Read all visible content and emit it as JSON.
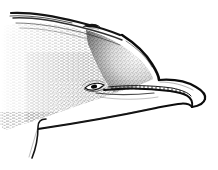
{
  "figure": {
    "view": "left lateral profile",
    "medium": "stipple and hatch pen-and-ink line drawing",
    "background_color": "#ffffff",
    "ink_color": "#1a1a1a",
    "shading_color": "#7a7a7a",
    "canvas": {
      "width": 218,
      "height": 170
    },
    "alt_text": "Black and white stippled line drawing of a dolphin head seen from the left side, showing the melon, blowhole, eye, a row of small teeth along the mouthline, the pointed rostrum and the lower jaw, with the body fading off the left edge of the frame."
  },
  "anatomy": {
    "parts": [
      {
        "id": "dorsal-ridge",
        "label": "Dorsal ridge",
        "description": "Multiple parallel dark contour strokes sweeping from upper left toward the blowhole"
      },
      {
        "id": "blowhole",
        "label": "Blowhole",
        "description": "Small dark crescent on the dorsal surface behind the melon"
      },
      {
        "id": "melon",
        "label": "Melon",
        "description": "Rounded forehead bulge with heavy graded shading on its leading edge"
      },
      {
        "id": "eye",
        "label": "Eye",
        "description": "Small almond shape with a dark pupil set low on the head behind the gape"
      },
      {
        "id": "tooth-row",
        "label": "Tooth row",
        "description": "Row of short vertical tick marks between two lines along the upper jaw"
      },
      {
        "id": "rostrum",
        "label": "Rostrum",
        "description": "Elongated beak tapering to a rounded tip at the right of the frame"
      },
      {
        "id": "mouthline",
        "label": "Mouthline",
        "description": "Long dark curve from below the eye forward to the tip of the beak"
      },
      {
        "id": "lower-jaw",
        "label": "Lower jaw",
        "description": "Sweeping lower contour running from the throat up to the beak tip"
      },
      {
        "id": "throat-crease",
        "label": "Throat crease",
        "description": "Hooked stroke descending from the lower jaw toward the lower left"
      },
      {
        "id": "flank-hatching",
        "label": "Flank hatching",
        "description": "Dense horizontal stipple texture covering the head and body mass"
      },
      {
        "id": "body-fade",
        "label": "Body fade",
        "description": "Feathered open boundary where the body continues past the left edge"
      }
    ]
  }
}
